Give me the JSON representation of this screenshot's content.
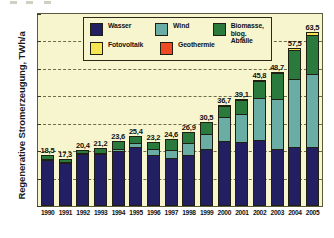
{
  "chart_data": {
    "type": "bar",
    "stacked": true,
    "title": "",
    "xlabel": "",
    "ylabel": "Regenerative Stromerzeugung, TWh/a",
    "ylim": [
      0,
      70
    ],
    "yticks": [
      0,
      10,
      20,
      30,
      40,
      50,
      60,
      70
    ],
    "grid": true,
    "legend_position": "top-center",
    "categories": [
      "1990",
      "1991",
      "1992",
      "1993",
      "1994",
      "1995",
      "1996",
      "1997",
      "1998",
      "1999",
      "2000",
      "2001",
      "2002",
      "2003",
      "2004",
      "2005"
    ],
    "series": [
      {
        "name": "Wasser",
        "color": "#221f63",
        "values": [
          17.0,
          15.9,
          19.0,
          18.8,
          19.9,
          21.5,
          18.6,
          17.4,
          18.5,
          20.7,
          24.9,
          23.2,
          23.8,
          20.4,
          21.1,
          21.5
        ]
      },
      {
        "name": "Wind",
        "color": "#6aada5",
        "values": [
          0.1,
          0.2,
          0.3,
          0.6,
          0.9,
          1.5,
          2.0,
          3.0,
          4.5,
          5.5,
          9.5,
          10.5,
          15.8,
          18.7,
          25.5,
          27.2
        ]
      },
      {
        "name": "Biomasse, biog. Abfälle",
        "color": "#2a7a3e",
        "values": [
          1.4,
          1.2,
          1.1,
          1.8,
          2.8,
          2.4,
          2.6,
          4.2,
          3.9,
          4.3,
          4.1,
          5.2,
          6.0,
          9.4,
          10.7,
          14.5
        ]
      },
      {
        "name": "Fotovoltaik",
        "color": "#f7e451",
        "values": [
          0.0,
          0.0,
          0.0,
          0.0,
          0.0,
          0.0,
          0.0,
          0.0,
          0.0,
          0.0,
          0.1,
          0.1,
          0.2,
          0.3,
          0.6,
          1.3
        ]
      },
      {
        "name": "Geothermie",
        "color": "#f04a25",
        "values": [
          0,
          0,
          0,
          0,
          0,
          0,
          0,
          0,
          0,
          0,
          0,
          0,
          0,
          0,
          0,
          0
        ]
      }
    ],
    "totals": [
      "18,5",
      "17,3",
      "20,4",
      "21,2",
      "23,6",
      "25,4",
      "23,2",
      "24,6",
      "26,9",
      "30,5",
      "36,7",
      "39,1",
      "45,8",
      "48,7",
      "57,5",
      "63,5"
    ],
    "totals_numeric": [
      18.5,
      17.3,
      20.4,
      21.2,
      23.6,
      25.4,
      23.2,
      24.6,
      26.9,
      30.5,
      36.7,
      39.1,
      45.8,
      48.7,
      57.5,
      63.5
    ],
    "plot_background": "#f7f5cd",
    "axis_color": "#1f1f14"
  },
  "legend": {
    "items": [
      {
        "label": "Wasser",
        "label2": "",
        "color": "#221f63"
      },
      {
        "label": "Wind",
        "label2": "",
        "color": "#6aada5"
      },
      {
        "label": "Biomasse,",
        "label2": "biog. Abfälle",
        "color": "#2a7a3e"
      },
      {
        "label": "Fotovoltaik",
        "label2": "",
        "color": "#f7e451"
      },
      {
        "label": "Geothermie",
        "label2": "",
        "color": "#f04a25"
      }
    ]
  }
}
